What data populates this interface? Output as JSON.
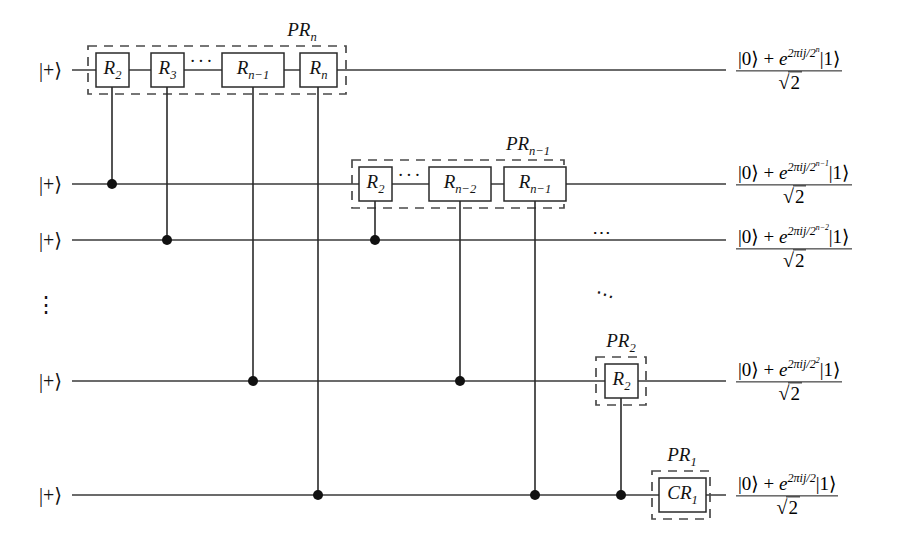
{
  "figure": {
    "kind": "quantum-circuit-diagram",
    "title_visible": false,
    "background": "#ffffff",
    "ink": "#1a1a1a"
  },
  "inputs": [
    {
      "label": "|+⟩",
      "row": 1
    },
    {
      "label": "|+⟩",
      "row": 2
    },
    {
      "label": "|+⟩",
      "row": 3
    },
    {
      "label": "|+⟩",
      "row": 4
    },
    {
      "label": "|+⟩",
      "row": 5
    }
  ],
  "row_ellipsis": {
    "vertical": "⋮",
    "horizontal": "⋯",
    "diagonal": "⋯"
  },
  "gates": [
    {
      "id": "g1",
      "row": 1,
      "base": "R",
      "sub": "2",
      "target_row": 2
    },
    {
      "id": "g2",
      "row": 1,
      "base": "R",
      "sub": "3",
      "target_row": 3
    },
    {
      "id": "g3",
      "row": 1,
      "base": "R",
      "sub": "n−1",
      "target_row": 4
    },
    {
      "id": "g4",
      "row": 1,
      "base": "R",
      "sub": "n",
      "target_row": 5
    },
    {
      "id": "g5",
      "row": 2,
      "base": "R",
      "sub": "2",
      "target_row": 3
    },
    {
      "id": "g6",
      "row": 2,
      "base": "R",
      "sub": "n−2",
      "target_row": 4
    },
    {
      "id": "g7",
      "row": 2,
      "base": "R",
      "sub": "n−1",
      "target_row": 5
    },
    {
      "id": "g8",
      "row": 4,
      "base": "R",
      "sub": "2",
      "target_row": 5
    },
    {
      "id": "g9",
      "row": 5,
      "base": "CR",
      "sub": "1",
      "target_row": null
    }
  ],
  "gate_groups": [
    {
      "id": "pr_n",
      "base": "PR",
      "sub": "n"
    },
    {
      "id": "pr_nm1",
      "base": "PR",
      "sub": "n−1"
    },
    {
      "id": "pr_2",
      "base": "PR",
      "sub": "2"
    },
    {
      "id": "pr_1",
      "base": "PR",
      "sub": "1"
    }
  ],
  "inline_ellipses": [
    {
      "id": "row1-dots",
      "text": "···"
    },
    {
      "id": "row2-dots",
      "text": "···"
    }
  ],
  "outputs": [
    {
      "row": 1,
      "numerator_pre": "|0⟩ + ",
      "exp_base": "e",
      "exp_sup": "2πij/2",
      "exp_sup_sup": "n",
      "numerator_post": "|1⟩",
      "denominator": "2"
    },
    {
      "row": 2,
      "numerator_pre": "|0⟩ + ",
      "exp_base": "e",
      "exp_sup": "2πij/2",
      "exp_sup_sup": "n−1",
      "numerator_post": "|1⟩",
      "denominator": "2"
    },
    {
      "row": 3,
      "numerator_pre": "|0⟩ + ",
      "exp_base": "e",
      "exp_sup": "2πij/2",
      "exp_sup_sup": "n−2",
      "numerator_post": "|1⟩",
      "denominator": "2"
    },
    {
      "row": 4,
      "numerator_pre": "|0⟩ + ",
      "exp_base": "e",
      "exp_sup": "2πij/2",
      "exp_sup_sup": "2",
      "numerator_post": "|1⟩",
      "denominator": "2"
    },
    {
      "row": 5,
      "numerator_pre": "|0⟩ + ",
      "exp_base": "e",
      "exp_sup": "2πij/2",
      "exp_sup_sup": "",
      "numerator_post": "|1⟩",
      "denominator": "2"
    }
  ]
}
